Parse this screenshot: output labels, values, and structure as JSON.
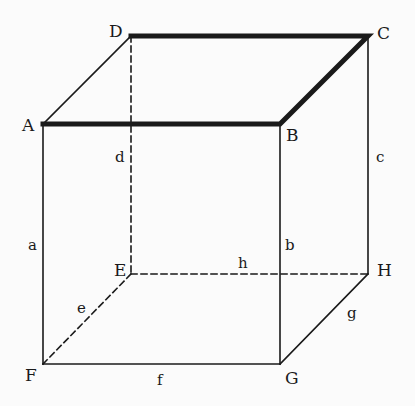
{
  "diagram": {
    "type": "cube-wireframe",
    "colors": {
      "line": "#1a1a1a",
      "background": "#fbfbfb"
    },
    "vertices": [
      {
        "id": "A",
        "label": "A",
        "x": 43,
        "y": 124
      },
      {
        "id": "B",
        "label": "B",
        "x": 280,
        "y": 124
      },
      {
        "id": "C",
        "label": "C",
        "x": 368,
        "y": 36
      },
      {
        "id": "D",
        "label": "D",
        "x": 131,
        "y": 36
      },
      {
        "id": "E",
        "label": "E",
        "x": 131,
        "y": 274
      },
      {
        "id": "F",
        "label": "F",
        "x": 43,
        "y": 364
      },
      {
        "id": "G",
        "label": "G",
        "x": 280,
        "y": 364
      },
      {
        "id": "H",
        "label": "H",
        "x": 368,
        "y": 274
      }
    ],
    "edges": [
      {
        "from": "A",
        "to": "D",
        "label": "",
        "style": "solid",
        "weight": "normal"
      },
      {
        "from": "D",
        "to": "C",
        "label": "",
        "style": "solid",
        "weight": "thick"
      },
      {
        "from": "A",
        "to": "B",
        "label": "",
        "style": "solid",
        "weight": "thick"
      },
      {
        "from": "B",
        "to": "C",
        "label": "",
        "style": "solid",
        "weight": "thick"
      },
      {
        "from": "A",
        "to": "F",
        "label": "a",
        "style": "solid",
        "weight": "normal"
      },
      {
        "from": "B",
        "to": "G",
        "label": "b",
        "style": "solid",
        "weight": "normal"
      },
      {
        "from": "C",
        "to": "H",
        "label": "c",
        "style": "solid",
        "weight": "normal"
      },
      {
        "from": "D",
        "to": "E",
        "label": "d",
        "style": "dashed",
        "weight": "normal"
      },
      {
        "from": "E",
        "to": "F",
        "label": "e",
        "style": "dashed",
        "weight": "normal"
      },
      {
        "from": "F",
        "to": "G",
        "label": "f",
        "style": "solid",
        "weight": "normal"
      },
      {
        "from": "G",
        "to": "H",
        "label": "g",
        "style": "solid",
        "weight": "normal"
      },
      {
        "from": "E",
        "to": "H",
        "label": "h",
        "style": "dashed",
        "weight": "normal"
      }
    ],
    "vertex_labels": {
      "A": {
        "text": "A",
        "x": 22,
        "y": 131
      },
      "B": {
        "text": "B",
        "x": 286,
        "y": 141
      },
      "C": {
        "text": "C",
        "x": 377,
        "y": 39
      },
      "D": {
        "text": "D",
        "x": 109,
        "y": 37
      },
      "E": {
        "text": "E",
        "x": 114,
        "y": 276
      },
      "F": {
        "text": "F",
        "x": 25,
        "y": 381
      },
      "G": {
        "text": "G",
        "x": 285,
        "y": 384
      },
      "H": {
        "text": "H",
        "x": 377,
        "y": 276
      }
    },
    "edge_labels": {
      "a": {
        "text": "a",
        "x": 28,
        "y": 250
      },
      "b": {
        "text": "b",
        "x": 285,
        "y": 250
      },
      "c": {
        "text": "c",
        "x": 376,
        "y": 162
      },
      "d": {
        "text": "d",
        "x": 115,
        "y": 162
      },
      "e": {
        "text": "e",
        "x": 77,
        "y": 313
      },
      "f": {
        "text": "f",
        "x": 157,
        "y": 385
      },
      "g": {
        "text": "g",
        "x": 347,
        "y": 318
      },
      "h": {
        "text": "h",
        "x": 238,
        "y": 268
      }
    }
  }
}
